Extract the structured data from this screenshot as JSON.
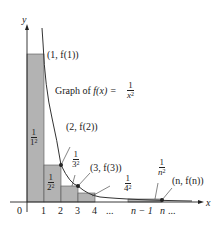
{
  "diagram": {
    "function_label": {
      "prefix": "Graph of ",
      "fx": "f(x) = ",
      "num": "1",
      "den": "x",
      "den_exp": "2"
    },
    "axes": {
      "x": "x",
      "y": "y"
    },
    "x_ticks": [
      "0",
      "1",
      "2",
      "3",
      "4",
      "...",
      "n − 1",
      "n",
      "..."
    ],
    "points": [
      {
        "label": "(1, f(1))"
      },
      {
        "label": "(2, f(2))"
      },
      {
        "label": "(3, f(3))"
      },
      {
        "label": "(n, f(n))"
      }
    ],
    "rect_labels": [
      {
        "num": "1",
        "den": "1",
        "exp": "2"
      },
      {
        "num": "1",
        "den": "2",
        "exp": "2"
      },
      {
        "num": "1",
        "den": "3",
        "exp": "2"
      },
      {
        "num": "1",
        "den": "4",
        "exp": "2"
      },
      {
        "num": "1",
        "den": "n",
        "exp": "2"
      }
    ],
    "colors": {
      "rect_fill": "#b3b3b3",
      "curve": "#333333",
      "axis": "#222222"
    }
  }
}
